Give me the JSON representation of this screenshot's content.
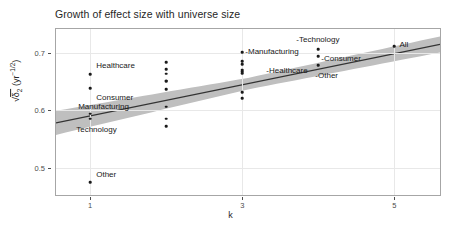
{
  "chart_data": {
    "type": "scatter",
    "title": "Growth of effect size with universe size",
    "xlabel": "k",
    "ylabel_parts": {
      "radical": "√",
      "delta": "δ",
      "delta_sub": "2",
      "unit_open": " (yr",
      "unit_exp": "−1/2",
      "unit_close": ")"
    },
    "ylabel": "√δ₂ (yr⁻¹ᐟ²)",
    "xlim": [
      0.55,
      5.6
    ],
    "ylim": [
      0.452,
      0.742
    ],
    "xticks": [
      1,
      3,
      5
    ],
    "xtick_labels": [
      "1",
      "3",
      "5"
    ],
    "yticks": [
      0.7,
      0.6,
      0.5
    ],
    "ytick_labels": [
      "0.7",
      "0.6",
      "0.5"
    ],
    "grid": true,
    "legend": "none",
    "line_color": "#333333",
    "ribbon_color": "#bfbfbf",
    "point_color": "#1a1a1a",
    "panel_border_color": "#a6a6a6",
    "regression": {
      "description": "linear fit with grey confidence ribbon",
      "x_start": 0.55,
      "y_start": 0.578,
      "x_end": 5.6,
      "y_end": 0.715,
      "ribbon_halfwidth_start": 0.021,
      "ribbon_halfwidth_mid": 0.01,
      "ribbon_halfwidth_end": 0.014
    },
    "points": [
      {
        "label": "Healthcare",
        "k": 1,
        "y": 0.663,
        "label_pos": "right",
        "label_dx": 6,
        "label_dy": -9
      },
      {
        "label": "Consumer",
        "k": 1,
        "y": 0.639,
        "label_pos": "right",
        "label_dx": 6,
        "label_dy": 9
      },
      {
        "label": "Manufacturing",
        "k": 1,
        "y": 0.594,
        "label_pos": "right",
        "label_dx": -12,
        "label_dy": -8
      },
      {
        "label": "Technology",
        "k": 1,
        "y": 0.585,
        "label_pos": "right",
        "label_dx": -14,
        "label_dy": 10
      },
      {
        "label": "Other",
        "k": 1,
        "y": 0.474,
        "label_pos": "right",
        "label_dx": 6,
        "label_dy": -8
      },
      {
        "label": "",
        "k": 2,
        "y": 0.684,
        "label_pos": "right",
        "label_dx": 0,
        "label_dy": 0
      },
      {
        "label": "",
        "k": 2,
        "y": 0.672,
        "label_pos": "right",
        "label_dx": 0,
        "label_dy": 0
      },
      {
        "label": "",
        "k": 2,
        "y": 0.664,
        "label_pos": "right",
        "label_dx": 0,
        "label_dy": 0
      },
      {
        "label": "",
        "k": 2,
        "y": 0.652,
        "label_pos": "right",
        "label_dx": 0,
        "label_dy": 0
      },
      {
        "label": "",
        "k": 2,
        "y": 0.651,
        "label_pos": "right",
        "label_dx": 0,
        "label_dy": 0
      },
      {
        "label": "",
        "k": 2,
        "y": 0.637,
        "label_pos": "right",
        "label_dx": 0,
        "label_dy": 0
      },
      {
        "label": "",
        "k": 2,
        "y": 0.606,
        "label_pos": "right",
        "label_dx": 0,
        "label_dy": 0
      },
      {
        "label": "",
        "k": 2,
        "y": 0.585,
        "label_pos": "right",
        "label_dx": 0,
        "label_dy": 0
      },
      {
        "label": "",
        "k": 2,
        "y": 0.572,
        "label_pos": "right",
        "label_dx": 0,
        "label_dy": 0
      },
      {
        "label": "-Manufacturing",
        "k": 3,
        "y": 0.701,
        "label_pos": "right",
        "label_dx": 3,
        "label_dy": -1
      },
      {
        "label": "-Healthcare",
        "k": 3,
        "y": 0.686,
        "label_pos": "right",
        "label_dx": 24,
        "label_dy": 9
      },
      {
        "label": "",
        "k": 3,
        "y": 0.68,
        "label_pos": "right",
        "label_dx": 0,
        "label_dy": 0
      },
      {
        "label": "",
        "k": 3,
        "y": 0.671,
        "label_pos": "right",
        "label_dx": 0,
        "label_dy": 0
      },
      {
        "label": "",
        "k": 3,
        "y": 0.668,
        "label_pos": "right",
        "label_dx": 0,
        "label_dy": 0
      },
      {
        "label": "",
        "k": 3,
        "y": 0.665,
        "label_pos": "right",
        "label_dx": 0,
        "label_dy": 0
      },
      {
        "label": "",
        "k": 3,
        "y": 0.632,
        "label_pos": "right",
        "label_dx": 0,
        "label_dy": 0
      },
      {
        "label": "",
        "k": 3,
        "y": 0.621,
        "label_pos": "right",
        "label_dx": 0,
        "label_dy": 0
      },
      {
        "label": "-Technology",
        "k": 4,
        "y": 0.707,
        "label_pos": "right",
        "label_dx": -22,
        "label_dy": -10
      },
      {
        "label": "-Consumer",
        "k": 4,
        "y": 0.694,
        "label_pos": "right",
        "label_dx": 3,
        "label_dy": 2
      },
      {
        "label": "-Other",
        "k": 4,
        "y": 0.679,
        "label_pos": "right",
        "label_dx": -3,
        "label_dy": 10
      },
      {
        "label": "All",
        "k": 5,
        "y": 0.712,
        "label_pos": "right",
        "label_dx": 5,
        "label_dy": -2
      }
    ]
  }
}
